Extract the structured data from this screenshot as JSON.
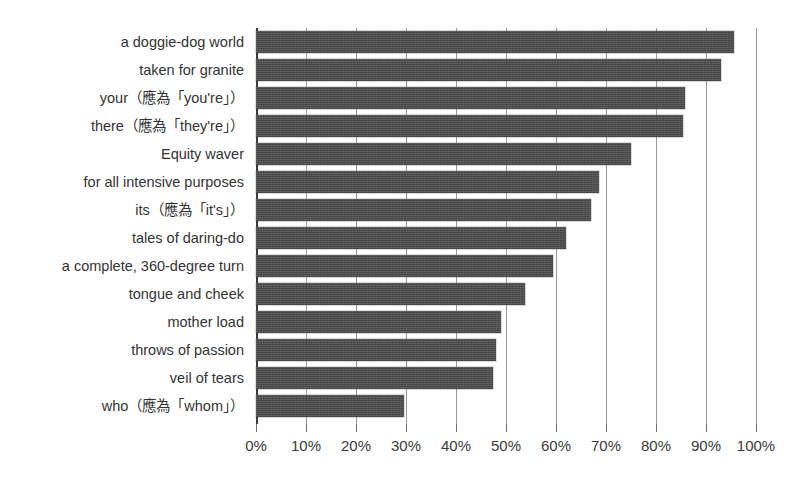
{
  "chart_data": {
    "type": "bar",
    "orientation": "horizontal",
    "title": "",
    "xlabel": "",
    "ylabel": "",
    "xlim": [
      0,
      100
    ],
    "xtick_step": 10,
    "xtick_labels": [
      "0%",
      "10%",
      "20%",
      "30%",
      "40%",
      "50%",
      "60%",
      "70%",
      "80%",
      "90%",
      "100%"
    ],
    "xtick_values": [
      0,
      10,
      20,
      30,
      40,
      50,
      60,
      70,
      80,
      90,
      100
    ],
    "grid": true,
    "grid_axis": "x",
    "legend": false,
    "value_unit": "%",
    "bar_color": "#4b4b4b",
    "gridline_color": "#9a9a9a",
    "axis_color": "#3c3c3c",
    "background_color": "#ffffff",
    "categories": [
      "a doggie-dog world",
      "taken for granite",
      "your（應為「you're」）",
      "there（應為「they're」）",
      "Equity waver",
      "for all intensive purposes",
      "its（應為「it's」）",
      "tales of daring-do",
      "a complete, 360-degree turn",
      "tongue and cheek",
      "mother load",
      "throws of passion",
      "veil of tears",
      "who（應為「whom」）"
    ],
    "values": [
      95.5,
      93.0,
      85.8,
      85.4,
      75.0,
      68.6,
      67.0,
      62.0,
      59.4,
      53.8,
      49.0,
      48.0,
      47.4,
      29.6
    ]
  }
}
